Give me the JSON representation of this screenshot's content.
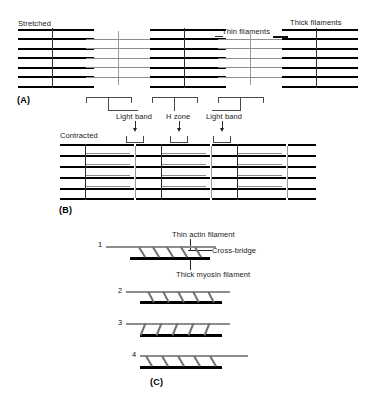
{
  "figure": {
    "type": "sarcomere-sliding-filament-diagram",
    "panels": [
      {
        "tag": "(A)",
        "state_label": "Stretched",
        "callouts": [
          {
            "name": "thin-filaments",
            "text": "Thin filaments"
          },
          {
            "name": "thick-filaments",
            "text": "Thick filaments"
          }
        ],
        "band_labels": [
          {
            "name": "light-band-left",
            "text": "Light band"
          },
          {
            "name": "h-zone",
            "text": "H zone"
          },
          {
            "name": "light-band-right",
            "text": "Light band"
          }
        ]
      },
      {
        "tag": "(B)",
        "state_label": "Contracted",
        "callouts": [],
        "band_labels": []
      },
      {
        "tag": "(C)",
        "state_label": "",
        "callouts": [
          {
            "name": "thin-actin-filament",
            "text": "Thin actin filament"
          },
          {
            "name": "cross-bridge",
            "text": "Cross-bridge"
          },
          {
            "name": "thick-myosin-filament",
            "text": "Thick myosin filament"
          }
        ],
        "steps": [
          {
            "number": "1"
          },
          {
            "number": "2"
          },
          {
            "number": "3"
          },
          {
            "number": "4"
          }
        ]
      }
    ],
    "colors": {
      "thick_filament": "#000000",
      "thin_filament": "#8d8d8d",
      "z_line": "#2e2e2e",
      "m_line": "#9a9a9a",
      "bracket": "#4a4a4a",
      "background": "#ffffff"
    }
  }
}
